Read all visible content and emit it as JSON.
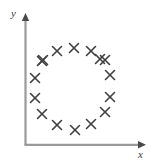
{
  "figure": {
    "width": 156,
    "height": 165,
    "background_color": "#ffffff"
  },
  "axes": {
    "x_label": "x",
    "y_label": "y",
    "line_color": "#9a9a9a",
    "arrow_color": "#555555",
    "origin_px": {
      "x": 25,
      "y": 145
    },
    "x_axis_end_px": {
      "x": 146,
      "y": 145
    },
    "y_axis_end_px": {
      "x": 25,
      "y": 14
    }
  },
  "chart_data": {
    "type": "scatter",
    "title": "",
    "xlabel": "x",
    "ylabel": "y",
    "grid": false,
    "legend": null,
    "marker": {
      "symbol": "x",
      "color": "#3f3f3f",
      "size_px": 9,
      "stroke_width_px": 1.6
    },
    "axis_arrows": true,
    "tick_labels": {
      "x": [],
      "y": []
    },
    "xlim": [
      0,
      1
    ],
    "ylim": [
      0,
      1
    ],
    "n_points": 16,
    "points_px": [
      {
        "x": 74,
        "y": 48
      },
      {
        "x": 91,
        "y": 51
      },
      {
        "x": 105,
        "y": 60
      },
      {
        "x": 110,
        "y": 75
      },
      {
        "x": 110,
        "y": 97
      },
      {
        "x": 105,
        "y": 112
      },
      {
        "x": 91,
        "y": 124
      },
      {
        "x": 75,
        "y": 130
      },
      {
        "x": 57,
        "y": 125
      },
      {
        "x": 42,
        "y": 114
      },
      {
        "x": 35,
        "y": 98
      },
      {
        "x": 35,
        "y": 78
      },
      {
        "x": 43,
        "y": 60
      },
      {
        "x": 57,
        "y": 51
      },
      {
        "x": 100,
        "y": 59
      },
      {
        "x": 42,
        "y": 61
      }
    ],
    "points": [
      {
        "x": 0.405,
        "y": 0.74
      },
      {
        "x": 0.545,
        "y": 0.718
      },
      {
        "x": 0.661,
        "y": 0.649
      },
      {
        "x": 0.702,
        "y": 0.534
      },
      {
        "x": 0.702,
        "y": 0.366
      },
      {
        "x": 0.661,
        "y": 0.252
      },
      {
        "x": 0.545,
        "y": 0.16
      },
      {
        "x": 0.413,
        "y": 0.115
      },
      {
        "x": 0.264,
        "y": 0.153
      },
      {
        "x": 0.14,
        "y": 0.237
      },
      {
        "x": 0.083,
        "y": 0.359
      },
      {
        "x": 0.083,
        "y": 0.511
      },
      {
        "x": 0.149,
        "y": 0.649
      },
      {
        "x": 0.264,
        "y": 0.718
      },
      {
        "x": 0.62,
        "y": 0.656
      },
      {
        "x": 0.14,
        "y": 0.641
      }
    ]
  }
}
